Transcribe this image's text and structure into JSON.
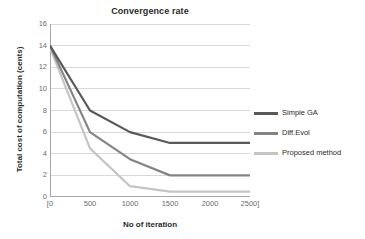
{
  "chart_data": {
    "type": "line",
    "title": "Convergence rate",
    "xlabel": "No of iteration",
    "ylabel": "Total cost of computation (cents)",
    "x": [
      0,
      500,
      1000,
      1500,
      2000,
      2500
    ],
    "xtick_labels": [
      "[0",
      "500",
      "1000",
      "1500",
      "2000",
      "2500]"
    ],
    "ytick_labels": [
      "0",
      "2",
      "4",
      "6",
      "8",
      "10",
      "12",
      "14",
      "16"
    ],
    "ytick_values": [
      0,
      2,
      4,
      6,
      8,
      10,
      12,
      14,
      16
    ],
    "xlim": [
      0,
      2500
    ],
    "ylim": [
      0,
      16
    ],
    "grid": "horizontal",
    "legend_position": "right",
    "series": [
      {
        "name": "Simple GA",
        "color": "#595959",
        "values": [
          14,
          8,
          6,
          5,
          5,
          5
        ]
      },
      {
        "name": "Diff.Evol",
        "color": "#848484",
        "values": [
          14,
          6,
          3.5,
          2,
          2,
          2
        ]
      },
      {
        "name": "Proposed method",
        "color": "#c4c4c4",
        "values": [
          13.8,
          4.5,
          1,
          0.5,
          0.5,
          0.5
        ]
      }
    ],
    "axis_color": "#a6a6a6",
    "grid_color": "#d9d9d9",
    "background": "#ffffff"
  }
}
